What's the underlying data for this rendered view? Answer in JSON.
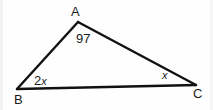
{
  "figure": {
    "type": "triangle-angle-diagram",
    "background_color": "#ffffff",
    "stroke_color": "#111111",
    "text_color": "#1b1b1b"
  },
  "vertices": [
    {
      "name": "A",
      "label": "A",
      "x": 78,
      "y": 22,
      "label_x": 71,
      "label_y": 5
    },
    {
      "name": "B",
      "label": "B",
      "x": 17,
      "y": 89,
      "label_x": 14,
      "label_y": 93
    },
    {
      "name": "C",
      "label": "C",
      "x": 196,
      "y": 85,
      "label_x": 193,
      "label_y": 87
    }
  ],
  "edges": [
    {
      "name": "AB",
      "from": "A",
      "to": "B"
    },
    {
      "name": "AC",
      "from": "A",
      "to": "C"
    },
    {
      "name": "BC",
      "from": "B",
      "to": "C"
    }
  ],
  "angles": [
    {
      "at": "A",
      "label": "97",
      "coefficient": "",
      "variable": ""
    },
    {
      "at": "B",
      "label": "2x",
      "coefficient": "2",
      "variable": "x"
    },
    {
      "at": "C",
      "label": "x",
      "coefficient": "",
      "variable": "x"
    }
  ],
  "labels": {
    "vertex_a": "A",
    "vertex_b": "B",
    "vertex_c": "C",
    "angle_a": "97",
    "angle_b_coefficient": "2",
    "angle_b_variable": "x",
    "angle_c_variable": "x"
  }
}
